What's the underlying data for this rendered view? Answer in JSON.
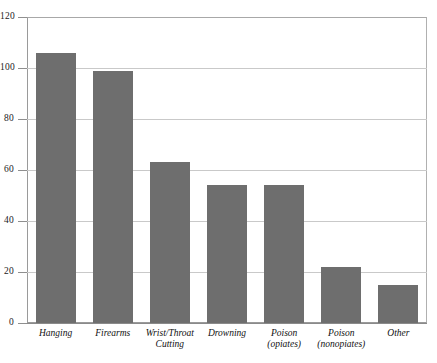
{
  "chart_data": {
    "type": "bar",
    "title": "",
    "xlabel": "",
    "ylabel": "",
    "categories": [
      "Hanging",
      "Firearms",
      "Wrist/Throat\nCutting",
      "Drowning",
      "Poison\n(opiates)",
      "Poison\n(nonopiates)",
      "Other"
    ],
    "values": [
      106,
      99,
      63,
      54,
      54,
      22,
      15
    ],
    "ylim": [
      0,
      120
    ],
    "yticks": [
      0,
      20,
      40,
      60,
      80,
      100,
      120
    ],
    "ytick_labels": [
      "0",
      "20",
      "40",
      "60",
      "80",
      "100",
      "120"
    ],
    "grid": true,
    "legend": "none",
    "bar_color": "#6e6e6e",
    "grid_color": "#c9c9c9",
    "axis_color": "#8f8f8f",
    "frame_color": "#9a9a9a"
  },
  "top_caption": {
    "text": "",
    "note": "cut-off partial line of text at top edge of page"
  }
}
